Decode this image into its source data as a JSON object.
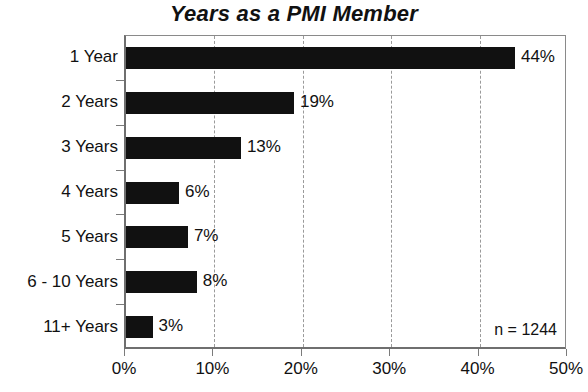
{
  "chart_data": {
    "type": "bar",
    "orientation": "horizontal",
    "title": "Years as a PMI Member",
    "xlabel": "",
    "ylabel": "",
    "categories": [
      "1 Year",
      "2 Years",
      "3 Years",
      "4 Years",
      "5 Years",
      "6 - 10 Years",
      "11+ Years"
    ],
    "values": [
      44,
      19,
      13,
      6,
      7,
      8,
      3
    ],
    "value_labels": [
      "44%",
      "19%",
      "13%",
      "6%",
      "7%",
      "8%",
      "3%"
    ],
    "xlim": [
      0,
      50
    ],
    "xticks": [
      0,
      10,
      20,
      30,
      40,
      50
    ],
    "xtick_labels": [
      "0%",
      "10%",
      "20%",
      "30%",
      "40%",
      "50%"
    ],
    "grid": "vertical-dashed",
    "legend": "none",
    "annotations": [
      "n = 1244"
    ],
    "bar_color": "#111111",
    "gridline_color": "#9a9a9a",
    "axis_color": "#6f6f6f",
    "background_color": "#ffffff"
  },
  "annotation": {
    "sample_size": "n = 1244"
  }
}
